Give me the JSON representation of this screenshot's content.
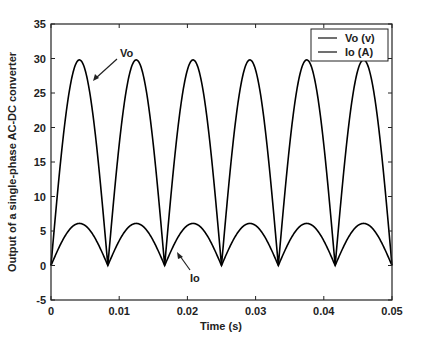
{
  "chart_data": {
    "type": "line",
    "title": "",
    "xlabel": "Time (s)",
    "ylabel": "Output of a single-phase AC-DC converter",
    "xlim": [
      0,
      0.05
    ],
    "ylim": [
      -5,
      35
    ],
    "xticks": [
      "0",
      "0.01",
      "0.02",
      "0.03",
      "0.04",
      "0.05"
    ],
    "yticks": [
      "-5",
      "0",
      "5",
      "10",
      "15",
      "20",
      "25",
      "30",
      "35"
    ],
    "grid": false,
    "legend_position": "upper right",
    "series": [
      {
        "name": "Vo (v)",
        "description": "full-wave rectified sine, 60 Hz source (period 1/120 s)",
        "amplitude": 29.8,
        "period": 0.008333,
        "color": "#000000"
      },
      {
        "name": "Io (A)",
        "description": "full-wave rectified sine, 60 Hz source (period 1/120 s)",
        "amplitude": 6.1,
        "period": 0.008333,
        "color": "#000000"
      }
    ],
    "x": [
      0,
      0.0042,
      0.0083,
      0.0125,
      0.0167,
      0.0208,
      0.025,
      0.0292,
      0.0333,
      0.0375,
      0.0417,
      0.0458,
      0.05
    ],
    "series_samples": [
      {
        "name": "Vo (v)",
        "values": [
          0,
          29.8,
          0,
          29.8,
          0,
          29.8,
          0,
          29.8,
          0,
          29.8,
          0,
          29.8,
          25.8
        ]
      },
      {
        "name": "Io (A)",
        "values": [
          0,
          6.1,
          0,
          6.1,
          0,
          6.1,
          0,
          6.1,
          0,
          6.1,
          0,
          6.1,
          5.3
        ]
      }
    ],
    "annotations": [
      {
        "text": "Vo",
        "arrow_to": [
          0.0128,
          27.5
        ]
      },
      {
        "text": "Io",
        "arrow_to": [
          0.0175,
          2.4
        ]
      }
    ]
  },
  "legend": {
    "items": [
      "Vo (v)",
      "Io (A)"
    ]
  },
  "annotations": {
    "vo": "Vo",
    "io": "Io"
  },
  "axes": {
    "xlabel": "Time (s)",
    "ylabel": "Output of a single-phase AC-DC converter",
    "xticks": [
      "0",
      "0.01",
      "0.02",
      "0.03",
      "0.04",
      "0.05"
    ],
    "yticks": [
      "-5",
      "0",
      "5",
      "10",
      "15",
      "20",
      "25",
      "30",
      "35"
    ]
  }
}
